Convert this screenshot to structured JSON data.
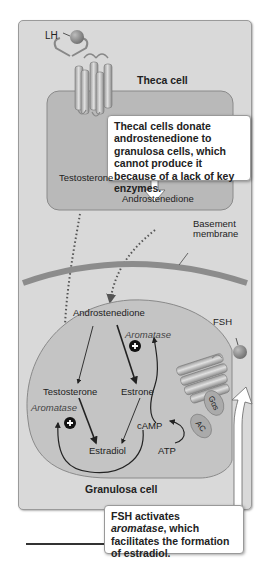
{
  "diagram": {
    "theca": {
      "title": "Theca cell",
      "hormone": "LH",
      "products": [
        "Testosterone",
        "Androstenedione"
      ],
      "callout": "Thecal cells donate androstenedione to granulosa cells, which cannot produce it because of a lack of key enzymes."
    },
    "basement_membrane": "Basement membrane",
    "basement_line1": "Basement",
    "basement_line2": "membrane",
    "granulosa": {
      "title": "Granulosa cell",
      "hormone": "FSH",
      "nodes": {
        "androstenedione": "Androstenedione",
        "testosterone": "Testosterone",
        "estrone": "Estrone",
        "estradiol": "Estradiol",
        "camp": "cAMP",
        "atp": "ATP"
      },
      "enzyme_labels": [
        "Aromatase",
        "Aromatase"
      ],
      "receptor_parts": {
        "g_protein": "Gαs",
        "adenylyl_cyclase": "AC"
      },
      "callout_part1": "FSH activates ",
      "callout_italic": "aromatase",
      "callout_part2": ", which facilitates the formation of estradiol."
    },
    "colors": {
      "panel_bg": "#d9d9d9",
      "cell_fill": "#c4c4c4",
      "membrane": "#8c8c8c",
      "hormone_ball": "#8a8a8a",
      "arrow": "#222222",
      "callout_bg": "#ffffff"
    }
  }
}
